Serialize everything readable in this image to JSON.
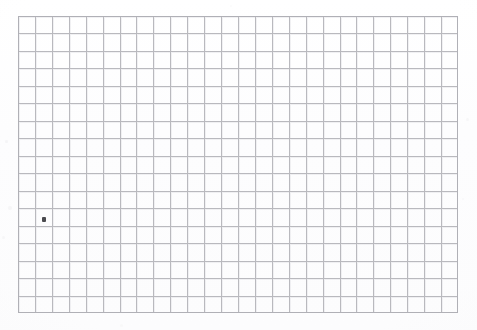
{
  "page": {
    "kind": "scanned-grid-paper",
    "width": 477,
    "height": 330,
    "background_color": "#fefefe",
    "paper_color": "#ffffff",
    "caption": ""
  },
  "grid": {
    "label": "graph-paper-grid",
    "left": 18,
    "top": 16,
    "right": 458,
    "bottom": 313,
    "width": 440,
    "height": 297,
    "columns": 26,
    "rows": 17,
    "cell_width": 16.92,
    "cell_height": 17.47,
    "line_color": "#b9b9be",
    "ghost_line_color": "#e6e6ea",
    "border_color": "#b0b0b6",
    "line_width": 1
  },
  "marks": [
    {
      "name": "ink-dot",
      "description": "small dark pen mark near a grid intersection",
      "x": 42,
      "y": 217,
      "width": 4,
      "height": 5,
      "color": "#4a4a4e",
      "grid_column": 2,
      "grid_row": 12
    }
  ],
  "specks": [
    {
      "x": 5,
      "y": 140,
      "size": 3,
      "opacity": 0.5
    },
    {
      "x": 8,
      "y": 206,
      "size": 4,
      "opacity": 0.45
    },
    {
      "x": 2,
      "y": 236,
      "size": 3,
      "opacity": 0.4
    },
    {
      "x": 466,
      "y": 118,
      "size": 3,
      "opacity": 0.4
    },
    {
      "x": 462,
      "y": 198,
      "size": 2,
      "opacity": 0.35
    },
    {
      "x": 230,
      "y": 5,
      "size": 2,
      "opacity": 0.3
    },
    {
      "x": 120,
      "y": 324,
      "size": 3,
      "opacity": 0.3
    }
  ]
}
